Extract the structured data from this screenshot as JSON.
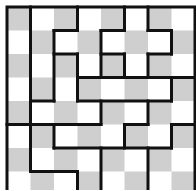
{
  "puzzle": {
    "rows": 8,
    "cols": 8,
    "cell_size": 23.5,
    "origin": [
      7,
      7
    ],
    "colors": {
      "light": "#ffffff",
      "dark": "#cfcfcf",
      "line": "#111111"
    },
    "checker_dark_parity": 0,
    "border_width": 3,
    "line_width": 3,
    "segments": [
      {
        "dir": "v",
        "at": 1,
        "from": 0,
        "to": 7
      },
      {
        "dir": "h",
        "at": 4,
        "from": 1,
        "to": 2
      },
      {
        "dir": "v",
        "at": 2,
        "from": 1,
        "to": 4
      },
      {
        "dir": "h",
        "at": 1,
        "from": 2,
        "to": 3
      },
      {
        "dir": "v",
        "at": 3,
        "from": 0,
        "to": 1
      },
      {
        "dir": "h",
        "at": 2,
        "from": 2,
        "to": 3
      },
      {
        "dir": "v",
        "at": 3,
        "from": 2,
        "to": 4
      },
      {
        "dir": "h",
        "at": 3,
        "from": 3,
        "to": 8
      },
      {
        "dir": "v",
        "at": 4,
        "from": 1,
        "to": 3
      },
      {
        "dir": "h",
        "at": 1,
        "from": 4,
        "to": 5
      },
      {
        "dir": "v",
        "at": 5,
        "from": 0,
        "to": 1
      },
      {
        "dir": "h",
        "at": 2,
        "from": 4,
        "to": 5
      },
      {
        "dir": "v",
        "at": 5,
        "from": 2,
        "to": 3
      },
      {
        "dir": "v",
        "at": 6,
        "from": 2,
        "to": 3
      },
      {
        "dir": "h",
        "at": 2,
        "from": 6,
        "to": 7
      },
      {
        "dir": "v",
        "at": 7,
        "from": 1,
        "to": 2
      },
      {
        "dir": "h",
        "at": 1,
        "from": 6,
        "to": 7
      },
      {
        "dir": "v",
        "at": 6,
        "from": 0,
        "to": 1
      },
      {
        "dir": "h",
        "at": 4,
        "from": 3,
        "to": 7
      },
      {
        "dir": "v",
        "at": 7,
        "from": 3,
        "to": 4
      },
      {
        "dir": "v",
        "at": 4,
        "from": 4,
        "to": 5
      },
      {
        "dir": "h",
        "at": 5,
        "from": 0,
        "to": 4
      },
      {
        "dir": "v",
        "at": 6,
        "from": 4,
        "to": 5
      },
      {
        "dir": "h",
        "at": 5,
        "from": 5,
        "to": 6
      },
      {
        "dir": "v",
        "at": 5,
        "from": 5,
        "to": 6
      },
      {
        "dir": "h",
        "at": 6,
        "from": 2,
        "to": 7
      },
      {
        "dir": "v",
        "at": 7,
        "from": 5,
        "to": 6
      },
      {
        "dir": "h",
        "at": 5,
        "from": 7,
        "to": 8
      },
      {
        "dir": "v",
        "at": 2,
        "from": 5,
        "to": 6
      },
      {
        "dir": "h",
        "at": 7,
        "from": 1,
        "to": 3
      },
      {
        "dir": "v",
        "at": 3,
        "from": 7,
        "to": 8
      },
      {
        "dir": "v",
        "at": 4,
        "from": 6,
        "to": 8
      },
      {
        "dir": "v",
        "at": 6,
        "from": 6,
        "to": 8
      }
    ]
  }
}
